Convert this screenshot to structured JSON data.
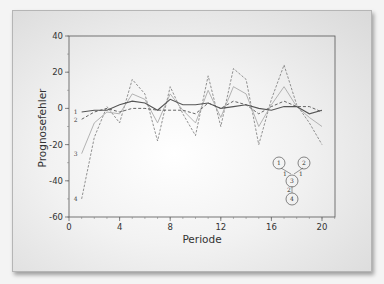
{
  "chart_data": {
    "type": "line",
    "title": "",
    "xlabel": "Periode",
    "ylabel": "Prognosefehler",
    "xlim": [
      0,
      21
    ],
    "ylim": [
      -60,
      40
    ],
    "x_ticks": [
      0,
      4,
      8,
      12,
      16,
      20
    ],
    "y_ticks": [
      40,
      20,
      0,
      -20,
      -40,
      -60
    ],
    "grid": false,
    "legend": "inline series labels 1-4 at left of each line",
    "x": [
      1,
      2,
      3,
      4,
      5,
      6,
      7,
      8,
      9,
      10,
      11,
      12,
      13,
      14,
      15,
      16,
      17,
      18,
      19,
      20
    ],
    "series": [
      {
        "name": "1",
        "style": "solid-dark",
        "values": [
          -2,
          -1,
          -1,
          2,
          4,
          3,
          -1,
          5,
          2,
          2,
          3,
          0,
          1,
          2,
          0,
          -1,
          1,
          1,
          -3,
          -1
        ]
      },
      {
        "name": "2",
        "style": "dashed-dark",
        "values": [
          -6,
          -2,
          0,
          -2,
          0,
          0,
          -1,
          -1,
          -1,
          -3,
          3,
          0,
          4,
          2,
          -3,
          1,
          4,
          1,
          1,
          -2
        ]
      },
      {
        "name": "3",
        "style": "solid-light",
        "values": [
          -25,
          -8,
          -2,
          -3,
          8,
          5,
          -8,
          8,
          -1,
          -8,
          10,
          -5,
          12,
          8,
          -10,
          2,
          12,
          1,
          -5,
          -10
        ]
      },
      {
        "name": "4",
        "style": "dashed-light",
        "values": [
          -50,
          -16,
          1,
          -8,
          16,
          8,
          -18,
          12,
          -3,
          -15,
          18,
          -10,
          22,
          16,
          -20,
          5,
          24,
          2,
          -8,
          -20
        ]
      }
    ],
    "annotations": {
      "network_diagram": {
        "nodes": [
          "1",
          "2",
          "3",
          "4"
        ],
        "edges": [
          {
            "from": "1",
            "to": "3",
            "label": "1"
          },
          {
            "from": "2",
            "to": "3",
            "label": "1"
          },
          {
            "from": "3",
            "to": "4",
            "label": "2"
          }
        ]
      }
    }
  },
  "labels": {
    "xlabel": "Periode",
    "ylabel": "Prognosefehler",
    "xticks": [
      "0",
      "4",
      "8",
      "12",
      "16",
      "20"
    ],
    "yticks": [
      "40",
      "20",
      "0",
      "-20",
      "-40",
      "-60"
    ],
    "series_labels": [
      "1",
      "2",
      "3",
      "4"
    ],
    "nodes": [
      "1",
      "2",
      "3",
      "4"
    ],
    "edge_labels": [
      "1",
      "1",
      "2"
    ]
  },
  "colors": {
    "series1": "#555555",
    "series2": "#555555",
    "series3": "#aaaaaa",
    "series4": "#777777",
    "axis": "#444444"
  }
}
